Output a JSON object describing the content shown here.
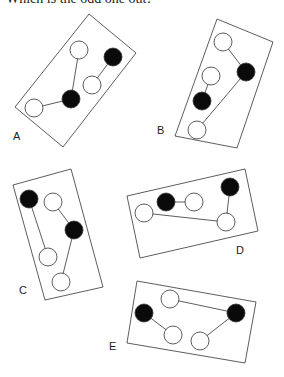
{
  "question": "Which is the odd one out?",
  "colors": {
    "stroke": "#333333",
    "filled": "#0a0a0a",
    "empty": "#ffffff"
  },
  "panels": [
    {
      "label": "A",
      "label_pos": [
        13,
        140
      ],
      "rect": [
        [
          89,
          14
        ],
        [
          136,
          53
        ],
        [
          63,
          147
        ],
        [
          15,
          107
        ]
      ],
      "circles": [
        {
          "x": 79,
          "y": 50,
          "fill": "white"
        },
        {
          "x": 113,
          "y": 57,
          "fill": "black"
        },
        {
          "x": 92,
          "y": 85,
          "fill": "white"
        },
        {
          "x": 71,
          "y": 99,
          "fill": "black"
        },
        {
          "x": 34,
          "y": 108,
          "fill": "white"
        }
      ],
      "links": [
        [
          0,
          3
        ],
        [
          3,
          4
        ],
        [
          2,
          1
        ]
      ]
    },
    {
      "label": "B",
      "label_pos": [
        157,
        134
      ],
      "rect": [
        [
          217,
          19
        ],
        [
          273,
          42
        ],
        [
          237,
          148
        ],
        [
          175,
          136
        ]
      ],
      "circles": [
        {
          "x": 223,
          "y": 42,
          "fill": "white"
        },
        {
          "x": 246,
          "y": 72,
          "fill": "black"
        },
        {
          "x": 211,
          "y": 76,
          "fill": "white"
        },
        {
          "x": 202,
          "y": 101,
          "fill": "black"
        },
        {
          "x": 197,
          "y": 130,
          "fill": "white"
        }
      ],
      "links": [
        [
          0,
          1
        ],
        [
          1,
          4
        ],
        [
          2,
          3
        ]
      ]
    },
    {
      "label": "C",
      "label_pos": [
        19,
        294
      ],
      "rect": [
        [
          13,
          185
        ],
        [
          71,
          169
        ],
        [
          103,
          287
        ],
        [
          45,
          300
        ]
      ],
      "circles": [
        {
          "x": 29,
          "y": 199,
          "fill": "black"
        },
        {
          "x": 53,
          "y": 202,
          "fill": "white"
        },
        {
          "x": 74,
          "y": 230,
          "fill": "black"
        },
        {
          "x": 48,
          "y": 257,
          "fill": "white"
        },
        {
          "x": 61,
          "y": 282,
          "fill": "white"
        }
      ],
      "links": [
        [
          0,
          3
        ],
        [
          1,
          2
        ],
        [
          2,
          4
        ]
      ]
    },
    {
      "label": "D",
      "label_pos": [
        236,
        254
      ],
      "rect": [
        [
          127,
          196
        ],
        [
          245,
          169
        ],
        [
          258,
          231
        ],
        [
          140,
          258
        ]
      ],
      "circles": [
        {
          "x": 144,
          "y": 213,
          "fill": "white"
        },
        {
          "x": 166,
          "y": 202,
          "fill": "black"
        },
        {
          "x": 194,
          "y": 202,
          "fill": "white"
        },
        {
          "x": 230,
          "y": 187,
          "fill": "black"
        },
        {
          "x": 226,
          "y": 222,
          "fill": "white"
        }
      ],
      "links": [
        [
          0,
          4
        ],
        [
          1,
          2
        ],
        [
          3,
          4
        ]
      ]
    },
    {
      "label": "E",
      "label_pos": [
        109,
        350
      ],
      "rect": [
        [
          137,
          281
        ],
        [
          256,
          302
        ],
        [
          245,
          363
        ],
        [
          127,
          343
        ]
      ],
      "circles": [
        {
          "x": 170,
          "y": 299,
          "fill": "white"
        },
        {
          "x": 144,
          "y": 313,
          "fill": "black"
        },
        {
          "x": 173,
          "y": 335,
          "fill": "white"
        },
        {
          "x": 200,
          "y": 341,
          "fill": "white"
        },
        {
          "x": 236,
          "y": 313,
          "fill": "black"
        }
      ],
      "links": [
        [
          0,
          4
        ],
        [
          1,
          2
        ],
        [
          3,
          4
        ]
      ]
    }
  ]
}
